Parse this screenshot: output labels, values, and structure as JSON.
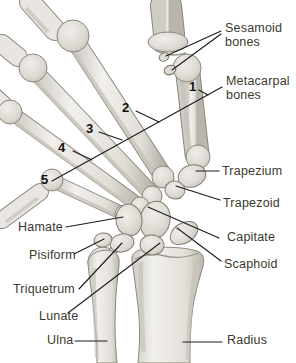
{
  "figure": {
    "kind": "anatomical-illustration"
  },
  "colors": {
    "background": "#ffffff",
    "label_text": "#3b392e",
    "number_text": "#14120c",
    "leader_line": "#1c1c1c",
    "bone_fill_light": "#eeebe6",
    "bone_fill_mid": "#dbd7d1",
    "bone_shade": "#c0bcb4",
    "bone_outline": "#8a867c"
  },
  "labels": {
    "sesamoid": "Sesamoid bones",
    "metacarpal": "Metacarpal bones",
    "trapezium": "Trapezium",
    "trapezoid": "Trapezoid",
    "capitate": "Capitate",
    "scaphoid": "Scaphoid",
    "radius": "Radius",
    "hamate": "Hamate",
    "pisiform": "Pisiform",
    "triquetrum": "Triquetrum",
    "lunate": "Lunate",
    "ulna": "Ulna"
  },
  "numbers": {
    "n1": "1",
    "n2": "2",
    "n3": "3",
    "n4": "4",
    "n5": "5"
  }
}
